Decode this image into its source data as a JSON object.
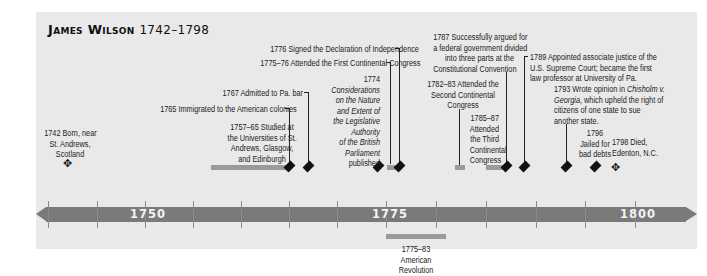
{
  "title": {
    "name": "James Wilson",
    "years": "1742–1798"
  },
  "colors": {
    "panel": "#e9e9e9",
    "bar": "#7a7a7a",
    "span": "#9a9a9a",
    "text": "#222222"
  },
  "axis": {
    "labels": [
      "1750",
      "1775",
      "1800"
    ],
    "tick_years": [
      1740,
      1745,
      1750,
      1755,
      1760,
      1765,
      1770,
      1775,
      1780,
      1785,
      1790,
      1795,
      1800
    ]
  },
  "events": {
    "e1742": {
      "line1": "1742 Born, near",
      "line2": "St. Andrews,",
      "line3": "Scotland",
      "marker": "hollow-diamond-icon"
    },
    "e1757": {
      "line1": "1757–65 Studied at",
      "line2": "the Universities of St.",
      "line3": "Andrews, Glasgow,",
      "line4": "and Edinburgh"
    },
    "e1765": {
      "text": "1765 Immigrated to the American colonies"
    },
    "e1767": {
      "text": "1767 Admitted to Pa. bar"
    },
    "e1774": {
      "year": "1774",
      "l1": "Considerations",
      "l2": "on the Nature",
      "l3": "and Extent of",
      "l4": "the Legislative",
      "l5": "Authority",
      "l6": "of the British",
      "l7": "Parliament",
      "l8": "published"
    },
    "e1775": {
      "text": "1775–76 Attended the First Continental Congress"
    },
    "e1776": {
      "text": "1776 Signed the Declaration of Independence"
    },
    "e1782": {
      "line1": "1782–83 Attended the",
      "line2": "Second Continental",
      "line3": "Congress"
    },
    "e1785": {
      "line1": "1785–87",
      "line2": "Attended",
      "line3": "the Third",
      "line4": "Continental",
      "line5": "Congress"
    },
    "e1787": {
      "line1": "1787 Successfully argued for",
      "line2": "a federal government divided",
      "line3": "into three parts at the",
      "line4": "Constitutional Convention"
    },
    "e1789": {
      "line1": "1789 Appointed associate justice of the",
      "line2": "U.S. Supreme Court; became the first",
      "line3": "law professor at University of Pa."
    },
    "e1793": {
      "pre": "1793 Wrote opinion in ",
      "case1": "Chisholm v.",
      "case2": "Georgia",
      "post2": ", which upheld the right of",
      "line3": "citizens of one state to sue",
      "line4": "another state."
    },
    "e1796": {
      "line1": "1796",
      "line2": "Jailed for",
      "line3": "bad debts"
    },
    "e1798": {
      "line1": "1798 Died,",
      "line2": "Edenton, N.C.",
      "marker": "hollow-diamond-icon"
    },
    "revolution": {
      "line1": "1775–83",
      "line2": "American",
      "line3": "Revolution"
    }
  },
  "icons": {
    "hollow_diamond": "✥"
  }
}
